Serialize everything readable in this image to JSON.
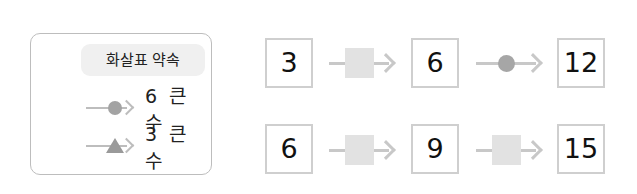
{
  "legend": {
    "title": "화살표 약속",
    "items": [
      {
        "symbol": "circle-arrow-icon",
        "label": "6 큰 수"
      },
      {
        "symbol": "triangle-arrow-icon",
        "label": "3 큰 수"
      }
    ]
  },
  "rows": [
    {
      "values": [
        "3",
        "6",
        "12"
      ],
      "connectors": [
        {
          "symbol": "blank-square",
          "state": "unknown"
        },
        {
          "symbol": "circle",
          "meaning": "6 큰 수"
        }
      ]
    },
    {
      "values": [
        "6",
        "9",
        "15"
      ],
      "connectors": [
        {
          "symbol": "blank-square",
          "state": "unknown"
        },
        {
          "symbol": "blank-square",
          "state": "unknown"
        }
      ]
    }
  ],
  "colors": {
    "box_border": "#cfcfcf",
    "arrow": "#c8c8c8",
    "blank_square": "#e2e2e2",
    "circle": "#a6a6a6",
    "legend_title_bg": "#f0f0f0"
  }
}
